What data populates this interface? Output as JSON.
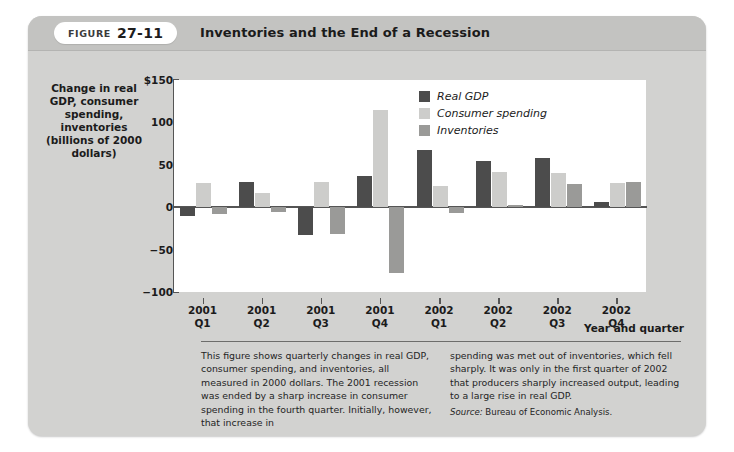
{
  "figure": {
    "tag_word": "FIGURE",
    "tag_number": "27-11",
    "title": "Inventories and the End of a Recession"
  },
  "axes": {
    "y_title": "Change in real GDP, consumer spending, inventories (billions of 2000 dollars)",
    "y_ticks": [
      "$150",
      "100",
      "50",
      "0",
      "−50",
      "−100"
    ],
    "x_title": "Year and quarter"
  },
  "legend": {
    "items": [
      {
        "label": "Real GDP",
        "color": "#4c4c4c"
      },
      {
        "label": "Consumer spending",
        "color": "#cdcdcb"
      },
      {
        "label": "Inventories",
        "color": "#9a9a98"
      }
    ]
  },
  "caption": {
    "left": "This figure shows quarterly changes in real GDP, consumer spending, and inventories, all measured in 2000 dollars. The 2001 recession was ended by a sharp increase in consumer spending in the fourth quarter. Initially, however, that increase in",
    "right": "spending was met out of inventories, which fell sharply. It was only in the first quarter of 2002 that producers sharply increased output, leading to a large rise in real GDP.",
    "source_label": "Source:",
    "source_text": "Bureau of Economic Analysis."
  },
  "chart_data": {
    "type": "bar",
    "title": "Inventories and the End of a Recession",
    "xlabel": "Year and quarter",
    "ylabel": "Change in real GDP, consumer spending, inventories (billions of 2000 dollars)",
    "ylim": [
      -100,
      150
    ],
    "yticks": [
      -100,
      -50,
      0,
      50,
      100,
      150
    ],
    "grid": false,
    "legend_position": "top-right",
    "categories": [
      "2001 Q1",
      "2001 Q2",
      "2001 Q3",
      "2001 Q4",
      "2002 Q1",
      "2002 Q2",
      "2002 Q3",
      "2002 Q4"
    ],
    "category_lines": [
      [
        "2001",
        "Q1"
      ],
      [
        "2001",
        "Q2"
      ],
      [
        "2001",
        "Q3"
      ],
      [
        "2001",
        "Q4"
      ],
      [
        "2002",
        "Q1"
      ],
      [
        "2002",
        "Q2"
      ],
      [
        "2002",
        "Q3"
      ],
      [
        "2002",
        "Q4"
      ]
    ],
    "series": [
      {
        "name": "Real GDP",
        "color": "#4c4c4c",
        "values": [
          -10,
          30,
          -33,
          37,
          67,
          54,
          58,
          6
        ]
      },
      {
        "name": "Consumer spending",
        "color": "#cdcdcb",
        "values": [
          28,
          17,
          30,
          115,
          25,
          41,
          40,
          28
        ]
      },
      {
        "name": "Inventories",
        "color": "#9a9a98",
        "values": [
          -8,
          -6,
          -32,
          -78,
          -7,
          3,
          27,
          30
        ]
      }
    ]
  }
}
